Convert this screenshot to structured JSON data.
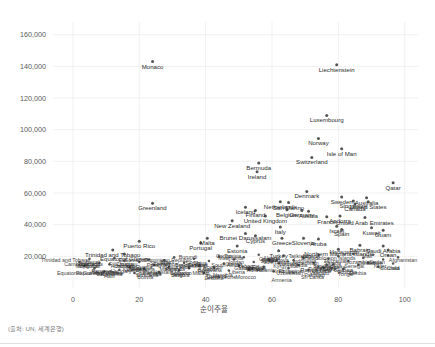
{
  "chart_data": {
    "type": "scatter",
    "title": "",
    "subtitle": "",
    "xlabel": "순이주율",
    "ylabel": "",
    "source_note": "(출처: UN, 세계은행)",
    "xlim": [
      -6,
      104
    ],
    "ylim": [
      0,
      168000
    ],
    "grid": true,
    "legend": false,
    "xticks": [
      "0",
      "20",
      "40",
      "60",
      "80",
      "100"
    ],
    "xtick_values": [
      0,
      20,
      40,
      60,
      80,
      100
    ],
    "yticks": [
      "20,000",
      "40,000",
      "60,000",
      "80,000",
      "100,000",
      "120,000",
      "140,000",
      "160,000"
    ],
    "ytick_values": [
      20000,
      40000,
      60000,
      80000,
      100000,
      120000,
      140000,
      160000
    ],
    "point_color": "#555555",
    "grid_color": "#ebebeb",
    "points": [
      {
        "label": "Monaco",
        "x": 24.0,
        "y": 143000
      },
      {
        "label": "Liechtenstein",
        "x": 79.5,
        "y": 141000
      },
      {
        "label": "Luxembourg",
        "x": 76.5,
        "y": 109000
      },
      {
        "label": "Norway",
        "x": 74.0,
        "y": 94500
      },
      {
        "label": "Isle of Man",
        "x": 81.0,
        "y": 88000
      },
      {
        "label": "Switzerland",
        "x": 72.0,
        "y": 82500
      },
      {
        "label": "Bermuda",
        "x": 56.0,
        "y": 79000
      },
      {
        "label": "Ireland",
        "x": 55.5,
        "y": 73500
      },
      {
        "label": "Qatar",
        "x": 96.5,
        "y": 66500
      },
      {
        "label": "Denmark",
        "x": 70.5,
        "y": 61000
      },
      {
        "label": "Sweden",
        "x": 81.0,
        "y": 57500
      },
      {
        "label": "Australia",
        "x": 88.5,
        "y": 57000
      },
      {
        "label": "Singapore",
        "x": 84.5,
        "y": 55000
      },
      {
        "label": "United States",
        "x": 89.0,
        "y": 54500
      },
      {
        "label": "Canada",
        "x": 85.0,
        "y": 53000
      },
      {
        "label": "Netherlands",
        "x": 62.5,
        "y": 54500
      },
      {
        "label": "San Marino",
        "x": 65.0,
        "y": 54000
      },
      {
        "label": "Greenland",
        "x": 24.0,
        "y": 53500
      },
      {
        "label": "Iceland",
        "x": 52.0,
        "y": 51000
      },
      {
        "label": "Finland",
        "x": 55.0,
        "y": 49000
      },
      {
        "label": "Belgium",
        "x": 64.5,
        "y": 49500
      },
      {
        "label": "Germany",
        "x": 69.0,
        "y": 49000
      },
      {
        "label": "Austria",
        "x": 71.0,
        "y": 48500
      },
      {
        "label": "United Kingdom",
        "x": 58.0,
        "y": 45500
      },
      {
        "label": "France",
        "x": 76.5,
        "y": 45000
      },
      {
        "label": "Andorra",
        "x": 80.5,
        "y": 45500
      },
      {
        "label": "United Arab Emirates",
        "x": 88.0,
        "y": 44500
      },
      {
        "label": "New Zealand",
        "x": 48.0,
        "y": 42500
      },
      {
        "label": "Italy",
        "x": 62.5,
        "y": 38500
      },
      {
        "label": "Israel",
        "x": 79.5,
        "y": 39000
      },
      {
        "label": "Spain",
        "x": 81.0,
        "y": 37000
      },
      {
        "label": "Kuwait",
        "x": 90.0,
        "y": 38000
      },
      {
        "label": "Guam",
        "x": 93.5,
        "y": 36500
      },
      {
        "label": "Brunei Darussalam",
        "x": 52.0,
        "y": 34500
      },
      {
        "label": "Cyprus",
        "x": 55.0,
        "y": 33000
      },
      {
        "label": "Greece",
        "x": 63.0,
        "y": 31500
      },
      {
        "label": "Slovenia",
        "x": 69.5,
        "y": 31500
      },
      {
        "label": "Aruba",
        "x": 74.0,
        "y": 31000
      },
      {
        "label": "Malta",
        "x": 40.5,
        "y": 31500
      },
      {
        "label": "Portugal",
        "x": 38.5,
        "y": 28500
      },
      {
        "label": "Puerto Rico",
        "x": 20.0,
        "y": 29500
      },
      {
        "label": "Bahrain",
        "x": 86.5,
        "y": 27000
      },
      {
        "label": "Saudi Arabia",
        "x": 93.5,
        "y": 26500
      },
      {
        "label": "Oman",
        "x": 95.0,
        "y": 24000
      },
      {
        "label": "Northern Mariana Islands",
        "x": 80.0,
        "y": 24500
      },
      {
        "label": "Estonia",
        "x": 49.5,
        "y": 26500
      },
      {
        "label": "Turkey",
        "x": 62.0,
        "y": 23500
      },
      {
        "label": "Trinidad and Tobago",
        "x": 12.0,
        "y": 24000
      },
      {
        "label": "Equatorial Guinea",
        "x": 15.5,
        "y": 21500
      },
      {
        "label": "Papua New Guinea",
        "x": 76.5,
        "y": 14500
      }
    ],
    "dense_cluster_note": "Large overlapping cluster of country labels below ~22,000 spanning the full x range",
    "cluster_points": [
      {
        "x": 2.0,
        "y": 16500
      },
      {
        "x": 3.5,
        "y": 14000
      },
      {
        "x": 5.0,
        "y": 18500
      },
      {
        "x": 6.5,
        "y": 12500
      },
      {
        "x": 8.0,
        "y": 16000
      },
      {
        "x": 9.5,
        "y": 10500
      },
      {
        "x": 11.0,
        "y": 15000
      },
      {
        "x": 12.5,
        "y": 19000
      },
      {
        "x": 14.0,
        "y": 11500
      },
      {
        "x": 15.5,
        "y": 17000
      },
      {
        "x": 17.0,
        "y": 13000
      },
      {
        "x": 18.5,
        "y": 9500
      },
      {
        "x": 20.0,
        "y": 16500
      },
      {
        "x": 21.5,
        "y": 12000
      },
      {
        "x": 23.0,
        "y": 18000
      },
      {
        "x": 24.5,
        "y": 14500
      },
      {
        "x": 26.0,
        "y": 10000
      },
      {
        "x": 27.5,
        "y": 17500
      },
      {
        "x": 29.0,
        "y": 13500
      },
      {
        "x": 30.5,
        "y": 19500
      },
      {
        "x": 32.0,
        "y": 11000
      },
      {
        "x": 33.5,
        "y": 16000
      },
      {
        "x": 35.0,
        "y": 12500
      },
      {
        "x": 36.5,
        "y": 18500
      },
      {
        "x": 38.0,
        "y": 14000
      },
      {
        "x": 39.5,
        "y": 9500
      },
      {
        "x": 41.0,
        "y": 17000
      },
      {
        "x": 42.5,
        "y": 13000
      },
      {
        "x": 44.0,
        "y": 20000
      },
      {
        "x": 45.5,
        "y": 15500
      },
      {
        "x": 47.0,
        "y": 11000
      },
      {
        "x": 48.5,
        "y": 18000
      },
      {
        "x": 50.0,
        "y": 14000
      },
      {
        "x": 51.5,
        "y": 19500
      },
      {
        "x": 53.0,
        "y": 12000
      },
      {
        "x": 54.5,
        "y": 16500
      },
      {
        "x": 56.0,
        "y": 21000
      },
      {
        "x": 57.5,
        "y": 13500
      },
      {
        "x": 59.0,
        "y": 18000
      },
      {
        "x": 60.5,
        "y": 10500
      },
      {
        "x": 62.0,
        "y": 15500
      },
      {
        "x": 63.5,
        "y": 20500
      },
      {
        "x": 65.0,
        "y": 12500
      },
      {
        "x": 66.5,
        "y": 17500
      },
      {
        "x": 68.0,
        "y": 14500
      },
      {
        "x": 69.5,
        "y": 19000
      },
      {
        "x": 71.0,
        "y": 11500
      },
      {
        "x": 72.5,
        "y": 16000
      },
      {
        "x": 74.0,
        "y": 21000
      },
      {
        "x": 75.5,
        "y": 13000
      },
      {
        "x": 77.0,
        "y": 18500
      },
      {
        "x": 78.5,
        "y": 15000
      },
      {
        "x": 80.0,
        "y": 20000
      },
      {
        "x": 81.5,
        "y": 12000
      },
      {
        "x": 83.0,
        "y": 17000
      },
      {
        "x": 84.5,
        "y": 21500
      },
      {
        "x": 86.0,
        "y": 14500
      },
      {
        "x": 87.5,
        "y": 19000
      },
      {
        "x": 89.0,
        "y": 16000
      },
      {
        "x": 90.5,
        "y": 21000
      },
      {
        "x": 92.0,
        "y": 13500
      },
      {
        "x": 93.5,
        "y": 18000
      },
      {
        "x": 95.0,
        "y": 20500
      },
      {
        "x": 96.5,
        "y": 15500
      },
      {
        "x": 98.0,
        "y": 19500
      }
    ],
    "cluster_labels": [
      "Trinidad and Tobago",
      "Equatorial Guinea",
      "Barbados",
      "Seychelles",
      "Argentina",
      "Panama",
      "Chile",
      "Uruguay",
      "Romania",
      "Croatia",
      "Poland",
      "Hungary",
      "Latvia",
      "Lithuania",
      "Slovakia",
      "Russia",
      "Kazakhstan",
      "Malaysia",
      "Mexico",
      "Brazil",
      "Bulgaria",
      "Serbia",
      "Costa Rica",
      "Colombia",
      "Peru",
      "Thailand",
      "China",
      "Ecuador",
      "South Africa",
      "Botswana",
      "Namibia",
      "Jordan",
      "Lebanon",
      "Tunisia",
      "Morocco",
      "Egypt",
      "Algeria",
      "Ukraine",
      "Georgia",
      "Armenia",
      "Albania",
      "Moldova",
      "Philippines",
      "Indonesia",
      "Vietnam",
      "India",
      "Pakistan",
      "Bangladesh",
      "Nigeria",
      "Kenya",
      "Ghana",
      "Uganda",
      "Tanzania",
      "Ethiopia",
      "Mozambique",
      "Madagascar",
      "Zambia",
      "Zimbabwe",
      "Senegal",
      "Mali",
      "Niger",
      "Chad",
      "Sudan",
      "Somalia",
      "Afghanistan",
      "Nepal",
      "Cambodia",
      "Myanmar",
      "Laos",
      "Mongolia",
      "Papua New Guinea",
      "Fiji",
      "Jamaica",
      "Haiti",
      "Honduras",
      "Nicaragua",
      "Guatemala",
      "El Salvador",
      "Bolivia",
      "Paraguay",
      "Venezuela",
      "Cuba",
      "Dominican Republic",
      "Angola",
      "Cameroon",
      "Benin",
      "Burkina Faso",
      "Rwanda",
      "Burundi",
      "Malawi",
      "Lesotho",
      "Eswatini",
      "Gabon",
      "Congo",
      "Liberia",
      "Sierra Leone",
      "Guinea",
      "Togo",
      "Mauritania",
      "Gambia",
      "Djibouti",
      "Eritrea",
      "Yemen",
      "Syria",
      "Iraq",
      "Iran",
      "Azerbaijan",
      "Uzbekistan",
      "Turkmenistan",
      "Kyrgyzstan",
      "Tajikistan",
      "Sri Lanka",
      "Maldives",
      "Bhutan",
      "Timor-Leste",
      "Solomon Islands",
      "Vanuatu",
      "Samoa",
      "Tonga"
    ]
  }
}
